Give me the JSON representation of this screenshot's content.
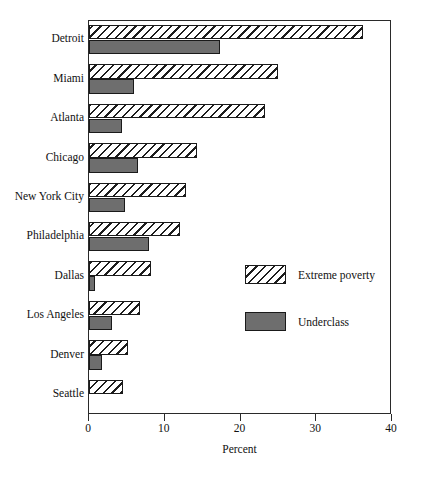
{
  "chart_data": {
    "type": "bar",
    "orientation": "horizontal",
    "title": "",
    "xlabel": "Percent",
    "ylabel": "",
    "xlim": [
      0,
      40
    ],
    "xticks": [
      0,
      10,
      20,
      30,
      40
    ],
    "xtick_labels": [
      "0",
      "10",
      "20",
      "30",
      "40"
    ],
    "grid": false,
    "legend_position": "inside-right",
    "categories": [
      "Detroit",
      "Miami",
      "Atlanta",
      "Chicago",
      "New York City",
      "Philadelphia",
      "Dallas",
      "Los Angeles",
      "Denver",
      "Seattle"
    ],
    "series": [
      {
        "name": "Extreme poverty",
        "fill": "hatched",
        "values": [
          36.2,
          25.0,
          23.2,
          14.2,
          12.8,
          12.0,
          8.2,
          6.7,
          5.2,
          4.5
        ]
      },
      {
        "name": "Underclass",
        "fill": "solid-gray",
        "values": [
          17.3,
          5.9,
          4.4,
          6.5,
          4.8,
          7.9,
          0.8,
          3.1,
          1.7,
          0.0
        ]
      }
    ],
    "colors": {
      "hatch_line": "#1d1d1d",
      "hatch_background": "#ffffff",
      "solid_fill": "#6e6e6e",
      "bar_border": "#1a1a1a",
      "axis": "#2a2a2a",
      "text": "#111111",
      "plot_background": "#ffffff"
    }
  },
  "legend": {
    "items": [
      {
        "label": "Extreme poverty",
        "style": "ep"
      },
      {
        "label": "Underclass",
        "style": "uc"
      }
    ]
  }
}
